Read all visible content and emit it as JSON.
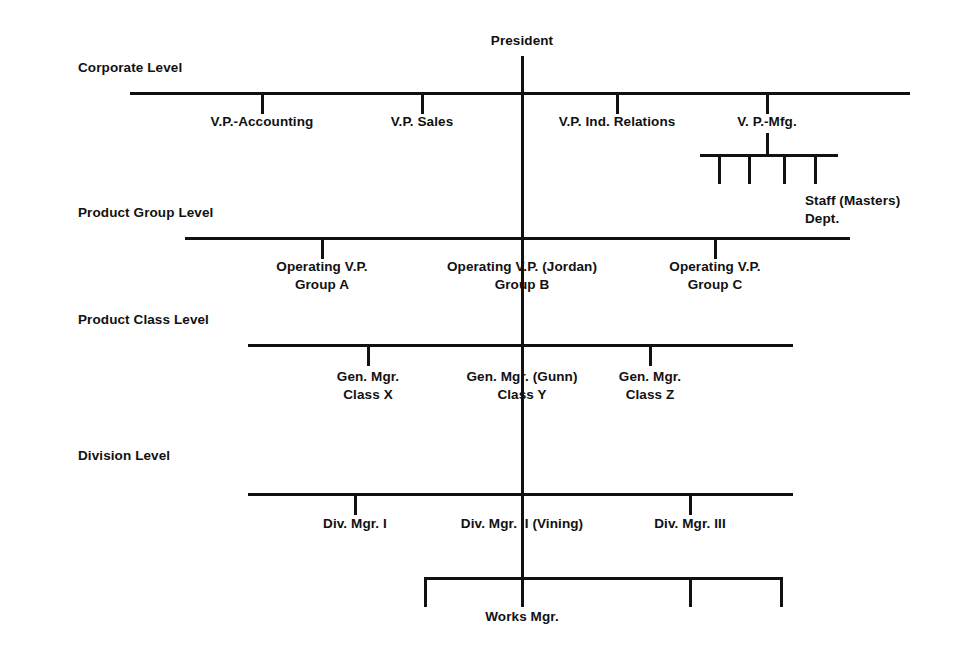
{
  "diagram": {
    "line_color": "#111111",
    "background_color": "#ffffff"
  },
  "levels": [
    {
      "label": "Corporate Level"
    },
    {
      "label": "Product Group Level"
    },
    {
      "label": "Product Class Level"
    },
    {
      "label": "Division Level"
    }
  ],
  "nodes": {
    "president": {
      "label": "President"
    },
    "corporate": [
      {
        "label": "V.P.-Accounting"
      },
      {
        "label": "V.P. Sales"
      },
      {
        "label": "V.P. Ind. Relations"
      },
      {
        "label": "V. P.-Mfg."
      }
    ],
    "staff_dept": {
      "line1": "Staff (Masters)",
      "line2": "Dept."
    },
    "product_group": [
      {
        "line1": "Operating V.P.",
        "line2": "Group A"
      },
      {
        "line1": "Operating V.P. (Jordan)",
        "line2": "Group B"
      },
      {
        "line1": "Operating V.P.",
        "line2": "Group C"
      }
    ],
    "product_class": [
      {
        "line1": "Gen. Mgr.",
        "line2": "Class X"
      },
      {
        "line1": "Gen. Mgr. (Gunn)",
        "line2": "Class Y"
      },
      {
        "line1": "Gen. Mgr.",
        "line2": "Class Z"
      }
    ],
    "division": [
      {
        "label": "Div. Mgr. I"
      },
      {
        "label": "Div. Mgr. II (Vining)"
      },
      {
        "label": "Div. Mgr. III"
      }
    ],
    "works_manager": {
      "label": "Works Mgr."
    }
  }
}
